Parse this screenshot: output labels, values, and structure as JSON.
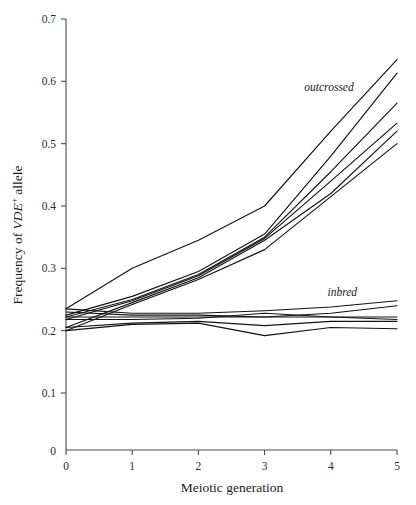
{
  "figure": {
    "background_color": "#ffffff",
    "line_color": "#131313",
    "axis_color": "#4a4a4a"
  },
  "axes": {
    "y_title_prefix": "Frequency of ",
    "y_title_italic": "VDE",
    "y_title_sup": "+",
    "y_title_suffix": " allele",
    "x_title": "Meiotic generation"
  },
  "labels": {
    "outcrossed": "outcrossed",
    "inbred": "inbred"
  },
  "chart_data": {
    "type": "line",
    "title": "",
    "subtitle": "",
    "xlabel": "Meiotic generation",
    "ylabel": "Frequency of VDE+ allele",
    "xlim": [
      0,
      5
    ],
    "ylim": [
      0,
      0.7
    ],
    "xticks": [
      0,
      1,
      2,
      3,
      4,
      5
    ],
    "xtick_labels": [
      "0",
      "1",
      "2",
      "3",
      "4",
      "5"
    ],
    "yticks": [
      0.1,
      0.2,
      0.3,
      0.4,
      0.5,
      0.6,
      0.7
    ],
    "ytick_labels": [
      "0.1",
      "0.2",
      "0.3",
      "0.4",
      "0.5",
      "0.6",
      "0.7"
    ],
    "y_origin_label": "0",
    "grid": false,
    "legend": "none",
    "annotations": [
      {
        "text": "outcrossed",
        "x": 3.6,
        "y": 0.585,
        "style": "italic"
      },
      {
        "text": "inbred",
        "x": 3.95,
        "y": 0.255,
        "style": "italic"
      }
    ],
    "x": [
      0,
      1,
      2,
      3,
      4,
      5
    ],
    "series": [
      {
        "name": "outcrossed-1",
        "group": "outcrossed",
        "values": [
          0.235,
          0.3,
          0.345,
          0.4,
          0.52,
          0.635
        ]
      },
      {
        "name": "outcrossed-2",
        "group": "outcrossed",
        "values": [
          0.225,
          0.255,
          0.295,
          0.355,
          0.48,
          0.613
        ]
      },
      {
        "name": "outcrossed-3",
        "group": "outcrossed",
        "values": [
          0.222,
          0.25,
          0.29,
          0.35,
          0.455,
          0.565
        ]
      },
      {
        "name": "outcrossed-4",
        "group": "outcrossed",
        "values": [
          0.218,
          0.248,
          0.288,
          0.348,
          0.44,
          0.533
        ]
      },
      {
        "name": "outcrossed-5",
        "group": "outcrossed",
        "values": [
          0.205,
          0.245,
          0.285,
          0.345,
          0.42,
          0.52
        ]
      },
      {
        "name": "outcrossed-6",
        "group": "outcrossed",
        "values": [
          0.2,
          0.242,
          0.282,
          0.33,
          0.415,
          0.5
        ]
      },
      {
        "name": "inbred-1",
        "group": "inbred",
        "values": [
          0.235,
          0.228,
          0.228,
          0.232,
          0.238,
          0.248
        ]
      },
      {
        "name": "inbred-2",
        "group": "inbred",
        "values": [
          0.23,
          0.225,
          0.225,
          0.222,
          0.228,
          0.24
        ]
      },
      {
        "name": "inbred-3",
        "group": "inbred",
        "values": [
          0.222,
          0.222,
          0.222,
          0.222,
          0.222,
          0.222
        ]
      },
      {
        "name": "inbred-4",
        "group": "inbred",
        "values": [
          0.218,
          0.218,
          0.22,
          0.228,
          0.222,
          0.218
        ]
      },
      {
        "name": "inbred-5",
        "group": "inbred",
        "values": [
          0.205,
          0.212,
          0.215,
          0.208,
          0.215,
          0.215
        ]
      },
      {
        "name": "inbred-6",
        "group": "inbred",
        "values": [
          0.2,
          0.21,
          0.212,
          0.192,
          0.205,
          0.203
        ]
      }
    ]
  }
}
